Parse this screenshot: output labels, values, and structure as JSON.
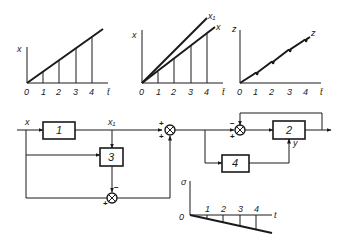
{
  "charts": [
    {
      "name": "chart-x",
      "y_label": "x",
      "x_label": "t̄",
      "origin_label": "0",
      "ticks": [
        "1",
        "2",
        "3",
        "4"
      ],
      "curves": [
        "x"
      ]
    },
    {
      "name": "chart-x-x1",
      "y_label": "x",
      "x_label": "t̄",
      "origin_label": "0",
      "ticks": [
        "1",
        "2",
        "3",
        "4"
      ],
      "curves": [
        "x1",
        "x"
      ],
      "curve_labels": {
        "x1": "x₁",
        "x": "x"
      }
    },
    {
      "name": "chart-z",
      "y_label": "z",
      "x_label": "t̄",
      "origin_label": "0",
      "ticks": [
        "1",
        "2",
        "3",
        "4"
      ],
      "curves": [
        "z"
      ],
      "curve_labels": {
        "z": "z"
      }
    },
    {
      "name": "chart-sigma",
      "y_label": "σ",
      "x_label": "t",
      "origin_label": "0",
      "ticks": [
        "1",
        "2",
        "3",
        "4"
      ],
      "curves": [
        "sigma"
      ]
    }
  ],
  "block_diagram": {
    "input_label": "x",
    "x1_label": "x₁",
    "y_label": "y",
    "blocks": [
      {
        "id": "1",
        "label": "1"
      },
      {
        "id": "2",
        "label": "2"
      },
      {
        "id": "3",
        "label": "3"
      },
      {
        "id": "4",
        "label": "4"
      }
    ],
    "summing_junctions": [
      {
        "id": "s1",
        "signs": [
          "+",
          "+"
        ]
      },
      {
        "id": "s2",
        "signs": [
          "−",
          "+"
        ]
      },
      {
        "id": "s3",
        "signs": [
          "−",
          "+"
        ]
      }
    ]
  },
  "colors": {
    "ink": "#1a1a1a",
    "background": "#ffffff"
  }
}
